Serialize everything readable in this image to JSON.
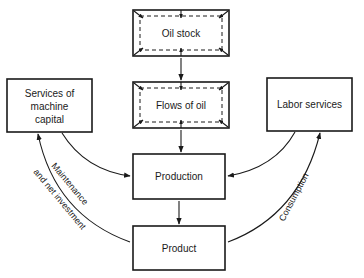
{
  "diagram": {
    "nodes": {
      "oil_stock": {
        "label": "Oil stock",
        "style": "double-dashed-with-corner-arrows"
      },
      "flows_of_oil": {
        "label": "Flows of oil",
        "style": "double-dashed-with-corner-arrows"
      },
      "services_machine_capital": {
        "line1": "Services of",
        "line2": "machine",
        "line3": "capital"
      },
      "labor_services": {
        "label": "Labor services"
      },
      "production": {
        "label": "Production"
      },
      "product": {
        "label": "Product"
      }
    },
    "edges": [
      {
        "from": "Oil stock",
        "to": "Flows of oil"
      },
      {
        "from": "Flows of oil",
        "to": "Production"
      },
      {
        "from": "Services of machine capital",
        "to": "Production"
      },
      {
        "from": "Labor services",
        "to": "Production"
      },
      {
        "from": "Production",
        "to": "Product"
      },
      {
        "from": "Product",
        "to": "Services of machine capital",
        "label": "Maintenance and net investment"
      },
      {
        "from": "Product",
        "to": "Labor services",
        "label": "Consumption"
      }
    ],
    "edge_labels": {
      "maintenance_line1": "Maintenance",
      "maintenance_line2": "and net investment",
      "consumption": "Consumption"
    }
  }
}
